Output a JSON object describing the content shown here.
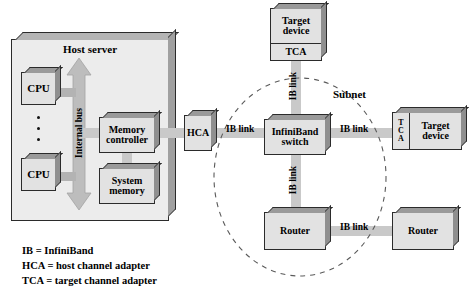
{
  "diagram": {
    "host_server": {
      "label": "Host server",
      "cpu_top": "CPU",
      "cpu_bottom": "CPU",
      "ellipsis": "⋮",
      "internal_bus": "Internal bus",
      "memory_controller": "Memory\ncontroller",
      "memory_controller_line1": "Memory",
      "memory_controller_line2": "controller",
      "system_memory_line1": "System",
      "system_memory_line2": "memory",
      "hca": "HCA"
    },
    "fabric": {
      "switch_line1": "InfiniBand",
      "switch_line2": "switch",
      "subnet": "Subnet",
      "router_left": "Router",
      "router_right": "Router",
      "target_device_top_line1": "Target",
      "target_device_top_line2": "device",
      "target_device_top_tca": "TCA",
      "target_device_right_line1": "Target",
      "target_device_right_line2": "device",
      "target_device_right_tca_t": "T",
      "target_device_right_tca_c": "C",
      "target_device_right_tca_a": "A"
    },
    "links": {
      "hca_to_switch": "IB link",
      "switch_to_top_target": "IB link",
      "switch_to_right_target": "IB link",
      "switch_to_router": "IB link",
      "router_to_router": "IB link"
    },
    "legend": {
      "line1": "IB = InfiniBand",
      "line2": "HCA = host channel adapter",
      "line3": "TCA = target channel adapter"
    },
    "colors": {
      "box_face": "#e2e2e2",
      "box_top_bevel": "#9a9a9a",
      "box_right_bevel": "#8f8f8f",
      "enclosure_face": "#ececec",
      "link_bar": "#c9c9c9",
      "outline": "#2b2b2b",
      "background": "#ffffff"
    }
  }
}
